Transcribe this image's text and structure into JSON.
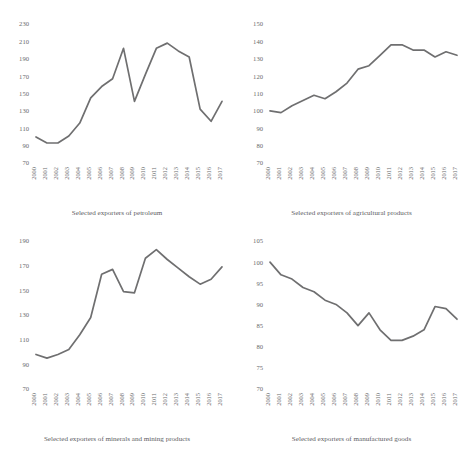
{
  "figure": {
    "top_title": "",
    "line_color": "#6f6f70",
    "text_color": "#5d5d5f",
    "background": "#ffffff"
  },
  "chart_data": [
    {
      "type": "line",
      "panel": "top-left",
      "title": "",
      "caption": "Selected exporters of petroleum",
      "xlabel": "",
      "ylabel": "",
      "grid": false,
      "legend": "none",
      "categories": [
        "2000",
        "2001",
        "2002",
        "2003",
        "2004",
        "2005",
        "2006",
        "2007",
        "2008",
        "2009",
        "2010",
        "2011",
        "2012",
        "2013",
        "2014",
        "2015",
        "2016",
        "2017"
      ],
      "values": [
        100,
        93,
        93,
        101,
        116,
        145,
        158,
        167,
        202,
        141,
        172,
        202,
        208,
        199,
        192,
        132,
        118,
        141
      ],
      "ylim": [
        70,
        230
      ],
      "yticks": [
        70,
        90,
        110,
        130,
        150,
        170,
        190,
        210,
        230
      ]
    },
    {
      "type": "line",
      "panel": "top-right",
      "title": "",
      "caption": "Selected exporters of agricultural products",
      "xlabel": "",
      "ylabel": "",
      "grid": false,
      "legend": "none",
      "categories": [
        "2000",
        "2001",
        "2002",
        "2003",
        "2004",
        "2005",
        "2006",
        "2007",
        "2008",
        "2009",
        "2010",
        "2011",
        "2012",
        "2013",
        "2014",
        "2015",
        "2016",
        "2017"
      ],
      "values": [
        100,
        99,
        103,
        106,
        109,
        107,
        111,
        116,
        124,
        126,
        132,
        138,
        138,
        135,
        135,
        131,
        134,
        132
      ],
      "ylim": [
        70,
        150
      ],
      "yticks": [
        70,
        80,
        90,
        100,
        110,
        120,
        130,
        140,
        150
      ]
    },
    {
      "type": "line",
      "panel": "bottom-left",
      "title": "",
      "caption": "Selected exporters of minerals and mining products",
      "xlabel": "",
      "ylabel": "",
      "grid": false,
      "legend": "none",
      "categories": [
        "2000",
        "2001",
        "2002",
        "2003",
        "2004",
        "2005",
        "2006",
        "2007",
        "2008",
        "2009",
        "2010",
        "2011",
        "2012",
        "2013",
        "2014",
        "2015",
        "2016",
        "2017"
      ],
      "values": [
        98,
        95,
        98,
        102,
        114,
        128,
        163,
        167,
        149,
        148,
        176,
        183,
        175,
        168,
        161,
        155,
        159,
        169
      ],
      "ylim": [
        70,
        190
      ],
      "yticks": [
        70,
        90,
        110,
        130,
        150,
        170,
        190
      ]
    },
    {
      "type": "line",
      "panel": "bottom-right",
      "title": "",
      "caption": "Selected exporters of manufactured goods",
      "xlabel": "",
      "ylabel": "",
      "grid": false,
      "legend": "none",
      "categories": [
        "2000",
        "2001",
        "2002",
        "2003",
        "2004",
        "2005",
        "2006",
        "2007",
        "2008",
        "2009",
        "2010",
        "2011",
        "2012",
        "2013",
        "2014",
        "2015",
        "2016",
        "2017"
      ],
      "values": [
        100,
        97,
        96,
        94,
        93,
        91,
        90,
        88,
        85,
        88,
        84,
        81.5,
        81.5,
        82.5,
        84,
        89.5,
        89,
        86.5
      ],
      "ylim": [
        70,
        105
      ],
      "yticks": [
        70,
        75,
        80,
        85,
        90,
        95,
        100,
        105
      ]
    }
  ]
}
